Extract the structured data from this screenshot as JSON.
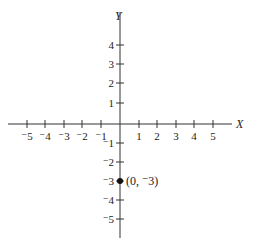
{
  "chart_data": {
    "type": "scatter",
    "title": "",
    "xlabel": "X",
    "ylabel": "Y",
    "xlim": [
      -5,
      5
    ],
    "ylim": [
      -5,
      4
    ],
    "grid": false,
    "x_ticks": [
      "-5",
      "-4",
      "-3",
      "-2",
      "-1",
      "1",
      "2",
      "3",
      "4",
      "5"
    ],
    "y_ticks": [
      "4",
      "3",
      "2",
      "1",
      "-1",
      "-2",
      "-3",
      "-4",
      "-5"
    ],
    "points": [
      {
        "x": 0,
        "y": -3,
        "label": "(0, -3)"
      }
    ]
  },
  "labels": {
    "x_axis": "X",
    "y_axis": "Y",
    "point": "(0, ⁻3)",
    "xt": [
      "⁻5",
      "⁻4",
      "⁻3",
      "⁻2",
      "⁻1",
      "1",
      "2",
      "3",
      "4",
      "5"
    ],
    "yt": [
      "4",
      "3",
      "2",
      "1",
      "⁻1",
      "⁻2",
      "⁻3",
      "⁻4",
      "⁻5"
    ]
  }
}
